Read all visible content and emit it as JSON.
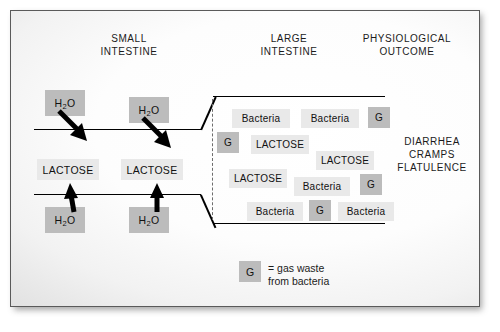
{
  "figure": {
    "headers": {
      "small_intestine": "SMALL\nINTESTINE",
      "large_intestine": "LARGE\nINTESTINE",
      "physiological_outcome": "PHYSIOLOGICAL\nOUTCOME"
    },
    "small_intestine": {
      "water_labels": [
        "H₂O",
        "H₂O",
        "H₂O",
        "H₂O"
      ],
      "lactose_labels": [
        "LACTOSE",
        "LACTOSE"
      ]
    },
    "large_intestine": {
      "contents": [
        {
          "label": "Bacteria",
          "type": "bacteria"
        },
        {
          "label": "Bacteria",
          "type": "bacteria"
        },
        {
          "label": "G",
          "type": "gas"
        },
        {
          "label": "G",
          "type": "gas"
        },
        {
          "label": "LACTOSE",
          "type": "lactose"
        },
        {
          "label": "LACTOSE",
          "type": "lactose"
        },
        {
          "label": "LACTOSE",
          "type": "lactose"
        },
        {
          "label": "Bacteria",
          "type": "bacteria"
        },
        {
          "label": "G",
          "type": "gas"
        },
        {
          "label": "Bacteria",
          "type": "bacteria"
        },
        {
          "label": "G",
          "type": "gas"
        },
        {
          "label": "Bacteria",
          "type": "bacteria"
        }
      ]
    },
    "outcome": {
      "text": "DIARRHEA\nCRAMPS\nFLATULENCE"
    },
    "legend": {
      "symbol": "G",
      "text": "= gas waste\nfrom bacteria"
    },
    "caption": "",
    "colors": {
      "line": "#000000",
      "chip_light": "#e9e9e9",
      "chip_dark": "#bcbcbc",
      "text": "#1b1b1b",
      "divider": "#6d6d6d"
    }
  }
}
